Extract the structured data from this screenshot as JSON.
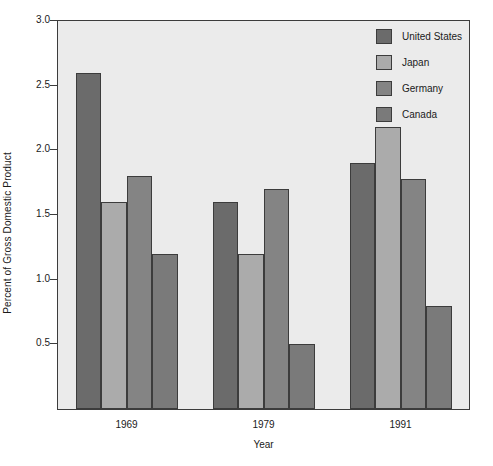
{
  "chart_data": {
    "type": "bar",
    "title": "",
    "subtitle": "",
    "xlabel": "Year",
    "ylabel": "Percent of Gross Domestic Product",
    "categories": [
      "1969",
      "1979",
      "1991"
    ],
    "series": [
      {
        "name": "United States",
        "color": "#6b6b6b",
        "values": [
          2.6,
          1.6,
          1.9
        ]
      },
      {
        "name": "Japan",
        "color": "#ababab",
        "values": [
          1.6,
          1.2,
          2.18
        ]
      },
      {
        "name": "Germany",
        "color": "#848484",
        "values": [
          1.8,
          1.7,
          1.78
        ]
      },
      {
        "name": "Canada",
        "color": "#7a7a7a",
        "values": [
          1.2,
          0.5,
          0.8
        ]
      }
    ],
    "ylim": [
      0,
      3.0
    ],
    "yticks": [
      0.5,
      1.0,
      1.5,
      2.0,
      2.5,
      3.0
    ],
    "ytick_labels": [
      "0.5",
      "1.0",
      "1.5",
      "2.0",
      "2.5",
      "3.0"
    ],
    "grid": false,
    "legend_position": "top-right",
    "plot_background": "#ebebeb",
    "figure_background": "#ffffff",
    "axis_color": "#3c3c3c"
  },
  "legend": {
    "entries": [
      {
        "label": "United States"
      },
      {
        "label": "Japan"
      },
      {
        "label": "Germany"
      },
      {
        "label": "Canada"
      }
    ]
  },
  "axes": {
    "x_title": "Year",
    "y_title": "Percent of Gross Domestic Product"
  }
}
